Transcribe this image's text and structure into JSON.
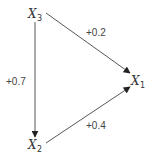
{
  "diagram": {
    "type": "directed-graph",
    "nodes": [
      {
        "id": "x3",
        "base": "X",
        "sub": "3"
      },
      {
        "id": "x1",
        "base": "X",
        "sub": "1"
      },
      {
        "id": "x2",
        "base": "X",
        "sub": "2"
      }
    ],
    "edges": [
      {
        "id": "x3-x1",
        "from": "x3",
        "to": "x1",
        "label": "+0.2"
      },
      {
        "id": "x3-x2",
        "from": "x3",
        "to": "x2",
        "label": "+0.7"
      },
      {
        "id": "x2-x1",
        "from": "x2",
        "to": "x1",
        "label": "+0.4"
      }
    ],
    "colors": {
      "line": "#444444",
      "text": "#333333"
    }
  }
}
